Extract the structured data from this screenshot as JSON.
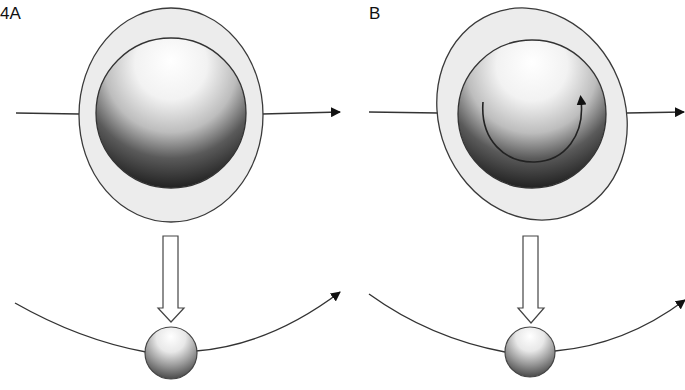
{
  "figure": {
    "panels": [
      {
        "id": "A",
        "label": "4A",
        "rotation_arrow": false,
        "outer_ellipse_tilt_deg": 0
      },
      {
        "id": "B",
        "label": "B",
        "rotation_arrow": true,
        "outer_ellipse_tilt_deg": -18
      }
    ],
    "colors": {
      "stroke": "#3a3a3a",
      "outer_fill": "#ececec",
      "sphere_light": "#ffffff",
      "sphere_dark": "#1e1e1e",
      "arrow": "#111111"
    }
  }
}
